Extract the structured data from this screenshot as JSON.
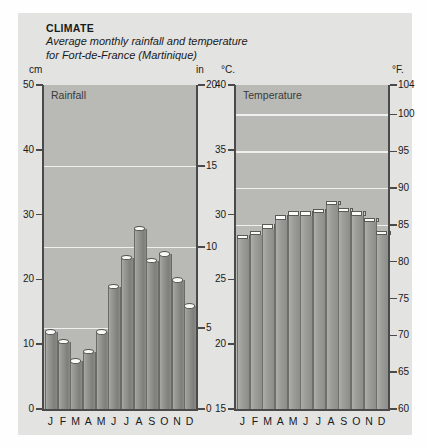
{
  "header": {
    "kicker": "CLIMATE",
    "subtitle_line1": "Average monthly rainfall and temperature",
    "subtitle_line2": "for Fort-de-France (Martinique)"
  },
  "units": {
    "cm": "cm",
    "in": "in",
    "celsius": "°C.",
    "fahrenheit": "°F."
  },
  "panels": {
    "rainfall_title": "Rainfall",
    "temperature_title": "Temperature"
  },
  "colors": {
    "page_background": "#fefefe",
    "panel_background": "#e3e3e1",
    "plot_background": "#b9b9b5",
    "gridline": "#f0f0ee",
    "axis": "#4a4a4a",
    "bar_fill": "#9a9a96",
    "bar_cap": "#fafaf8",
    "text": "#1a1a1a"
  },
  "chart_data": [
    {
      "type": "bar",
      "title": "Rainfall",
      "xlabel": "",
      "ylabel": "cm",
      "categories": [
        "J",
        "F",
        "M",
        "A",
        "M",
        "J",
        "J",
        "A",
        "S",
        "O",
        "N",
        "D"
      ],
      "values": [
        12,
        10.5,
        7.5,
        9,
        12,
        19,
        23.5,
        28,
        23,
        24,
        20,
        16
      ],
      "ylim": [
        0,
        50
      ],
      "yticks": [
        0,
        10,
        20,
        30,
        40,
        50
      ],
      "ytick_labels": [
        "0",
        "10",
        "20",
        "30",
        "40",
        "50"
      ],
      "secondary_axis": {
        "label": "in",
        "ylim": [
          0,
          20
        ],
        "yticks": [
          0,
          5,
          10,
          15,
          20
        ],
        "ytick_labels": [
          "0",
          "5",
          "10",
          "15",
          "20"
        ]
      },
      "gridlines_at_secondary": [
        5,
        10,
        15
      ],
      "grid": true,
      "legend": "none"
    },
    {
      "type": "bar",
      "title": "Temperature",
      "xlabel": "",
      "ylabel": "°C.",
      "categories": [
        "J",
        "F",
        "M",
        "A",
        "M",
        "J",
        "J",
        "A",
        "S",
        "O",
        "N",
        "D"
      ],
      "values": [
        28.2,
        28.5,
        29.0,
        29.7,
        30.0,
        30.0,
        30.2,
        30.8,
        30.3,
        30.0,
        29.5,
        28.5
      ],
      "ylim": [
        15,
        40
      ],
      "yticks": [
        15,
        20,
        25,
        30,
        35,
        40
      ],
      "ytick_labels": [
        "15",
        "20",
        "25",
        "30",
        "35",
        "40"
      ],
      "secondary_axis": {
        "label": "°F.",
        "ylim": [
          60,
          104
        ],
        "yticks": [
          60,
          65,
          70,
          75,
          80,
          85,
          90,
          95,
          100,
          104
        ],
        "ytick_labels": [
          "60",
          "65",
          "70",
          "75",
          "80",
          "85",
          "90",
          "95",
          "100",
          "104"
        ]
      },
      "gridlines_at_secondary": [
        85,
        90,
        95,
        100
      ],
      "grid": true,
      "legend": "none"
    }
  ]
}
